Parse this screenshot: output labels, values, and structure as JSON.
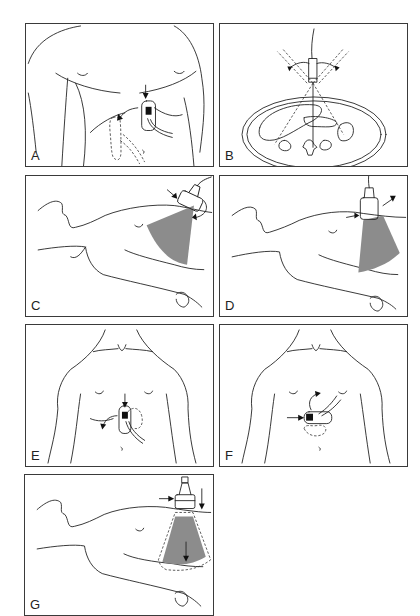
{
  "figure": {
    "panels": [
      {
        "id": "A",
        "label": "A",
        "view": "anterior torso, subcostal probe with rotation arrow"
      },
      {
        "id": "B",
        "label": "B",
        "view": "axial cross-section with probe fanning angles"
      },
      {
        "id": "C",
        "label": "C",
        "view": "supine lateral view, probe with rotation arrow and beam sector"
      },
      {
        "id": "D",
        "label": "D",
        "view": "supine lateral view, probe tilt with beam sector"
      },
      {
        "id": "E",
        "label": "E",
        "view": "anterior torso, subcostal probe with rotation arrow"
      },
      {
        "id": "F",
        "label": "F",
        "view": "anterior torso, transverse probe with rotation arrow"
      },
      {
        "id": "G",
        "label": "G",
        "view": "supine lateral view, probe pressed down with beam sector and depth arrow"
      }
    ]
  },
  "colors": {
    "line": "#222222",
    "frame": "#3a3a3a",
    "beam": "#8c8c8c",
    "background": "#ffffff"
  }
}
